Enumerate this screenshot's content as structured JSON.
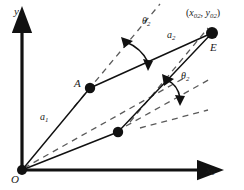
{
  "figure": {
    "type": "geometry-diagram",
    "background_color": "#ffffff",
    "ink_color": "#111111",
    "axes": {
      "origin_label": "O",
      "x_axis_label": "x",
      "x_axis_subscript": "0",
      "y_axis_label": "y",
      "y_axis_subscript": "0",
      "origin_px": [
        22,
        170
      ],
      "x_tip_px": [
        214,
        170
      ],
      "y_tip_px": [
        22,
        18
      ]
    },
    "points": [
      {
        "id": "O",
        "label": "O",
        "x": 22,
        "y": 170,
        "dot": true,
        "dot_r": 5
      },
      {
        "id": "A",
        "label": "A",
        "x": 90,
        "y": 88,
        "dot": true,
        "dot_r": 5
      },
      {
        "id": "B",
        "label": "",
        "x": 118,
        "y": 132,
        "dot": true,
        "dot_r": 5
      },
      {
        "id": "E",
        "label": "E",
        "x": 212,
        "y": 33,
        "dot": true,
        "dot_r": 6
      }
    ],
    "segments": [
      {
        "id": "O-A",
        "from": "O",
        "to": "A",
        "style": "solid",
        "label": "a",
        "label_sub": "1"
      },
      {
        "id": "A-E",
        "from": "A",
        "to": "E",
        "style": "solid",
        "label": "a",
        "label_sub": "2"
      },
      {
        "id": "O-B",
        "from": "O",
        "to": "B",
        "style": "solid",
        "label": "",
        "label_sub": ""
      },
      {
        "id": "B-E",
        "from": "B",
        "to": "E",
        "style": "solid",
        "label": "",
        "label_sub": ""
      }
    ],
    "dashed_lines": [
      {
        "id": "dash-through-A-up",
        "note": "extension of OA beyond A toward upper right"
      },
      {
        "id": "dash-through-A-parallel",
        "note": "reference direction at A parallel to OB"
      },
      {
        "id": "dash-through-E-parallel",
        "note": "reference direction at E parallel to OA extension"
      },
      {
        "id": "dash-through-B-parallel",
        "note": "reference direction at B, horizontal-ish"
      }
    ],
    "angles": [
      {
        "id": "theta-upper",
        "label": "θ",
        "sub": "2",
        "at": "A",
        "note": "between OA extension (dashed) and AE"
      },
      {
        "id": "theta-lower",
        "label": "θ",
        "sub": "2",
        "at": "E",
        "note": "between dashed reference and BE"
      }
    ],
    "coordinate_label": {
      "text_open": "(",
      "x_sym": "x",
      "x_sub": "02",
      "sep": ", ",
      "y_sym": "y",
      "y_sub": "02",
      "text_close": ")"
    },
    "labels": {
      "a1": "a",
      "a1_sub": "1",
      "a2": "a",
      "a2_sub": "2",
      "theta": "θ",
      "theta_sub": "2",
      "point_A": "A",
      "point_E": "E",
      "origin": "O"
    }
  }
}
